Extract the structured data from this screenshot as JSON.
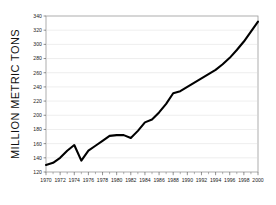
{
  "chart_data": {
    "type": "line",
    "title": "",
    "subtitle": "",
    "xlabel": "",
    "ylabel": "MILLION METRIC TONS",
    "xlim": [
      1970,
      2000
    ],
    "ylim": [
      120,
      340
    ],
    "grid": true,
    "grid_axis": "y",
    "legend": false,
    "legend_position": "none",
    "y_ticks": [
      120,
      140,
      160,
      180,
      200,
      220,
      240,
      260,
      280,
      300,
      320,
      340
    ],
    "y_tick_labels": [
      "120",
      "140",
      "160",
      "180",
      "200",
      "220",
      "240",
      "260",
      "280",
      "300",
      "320",
      "340"
    ],
    "x_ticks": [
      1970,
      1971,
      1972,
      1973,
      1974,
      1975,
      1976,
      1977,
      1978,
      1979,
      1980,
      1981,
      1982,
      1983,
      1984,
      1985,
      1986,
      1987,
      1988,
      1989,
      1990,
      1991,
      1992,
      1993,
      1994,
      1995,
      1996,
      1997,
      1998,
      1999,
      2000
    ],
    "x_tick_labels": [
      "1970",
      "1972",
      "1974",
      "1976",
      "1978",
      "1980",
      "1982",
      "1984",
      "1986",
      "1988",
      "1990",
      "1992",
      "1994",
      "1996",
      "1998",
      "2000"
    ],
    "x_labeled_ticks": [
      1970,
      1972,
      1974,
      1976,
      1978,
      1980,
      1982,
      1984,
      1986,
      1988,
      1990,
      1992,
      1994,
      1996,
      1998,
      2000
    ],
    "series": [
      {
        "name": "Production",
        "color": "#000000",
        "x": [
          1970,
          1971,
          1972,
          1973,
          1974,
          1975,
          1976,
          1977,
          1978,
          1979,
          1980,
          1981,
          1982,
          1983,
          1984,
          1985,
          1986,
          1987,
          1988,
          1989,
          1990,
          1991,
          1992,
          1993,
          1994,
          1995,
          1996,
          1997,
          1998,
          1999,
          2000
        ],
        "values": [
          130,
          133,
          140,
          150,
          158,
          136,
          150,
          157,
          164,
          171,
          172,
          172,
          168,
          178,
          190,
          194,
          204,
          216,
          231,
          234,
          240,
          246,
          252,
          258,
          264,
          272,
          281,
          292,
          304,
          318,
          332
        ]
      }
    ]
  },
  "axis": {
    "y_axis_title": "MILLION METRIC TONS"
  }
}
